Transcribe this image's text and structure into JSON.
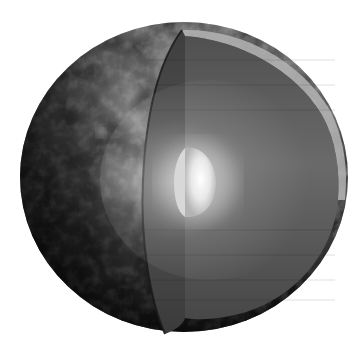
{
  "image": {
    "subject": "planet-cutaway",
    "description": "Grayscale 3D rendering of a cratered moon/planet with a wedge cut away revealing layered interior and bright glowing core",
    "background_color": "#ffffff",
    "colors": {
      "surface_light": "#9a9a9a",
      "surface_mid": "#6a6a6a",
      "surface_dark": "#1e1e1e",
      "cut_front_face": "#4a4a4a",
      "cut_side_face": "#5e5e5e",
      "crust_rim": "#b8b8b8",
      "core_glow": "#f2f2f2",
      "edge_shadow": "#2a2a2a"
    }
  }
}
